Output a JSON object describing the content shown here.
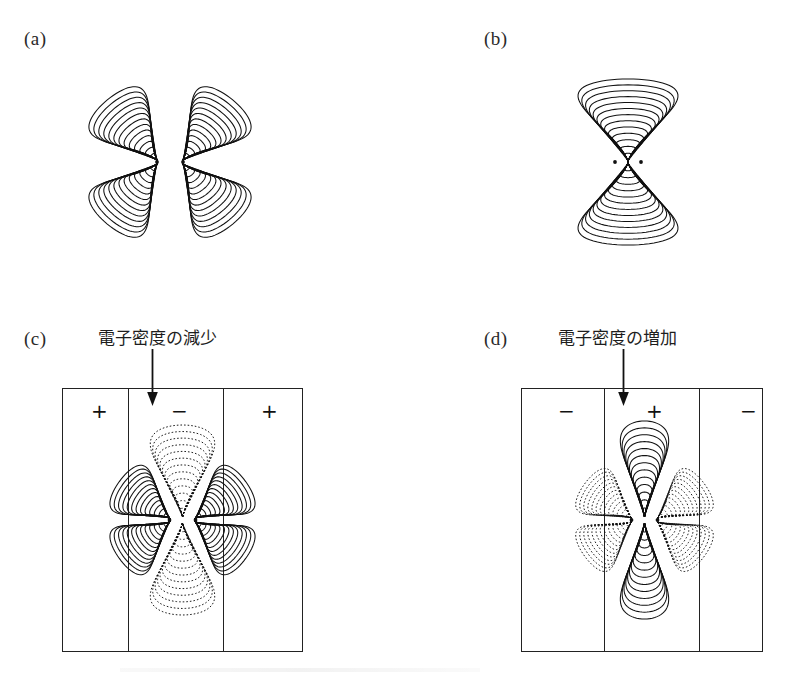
{
  "figure": {
    "background": "#ffffff",
    "ink": "#1a1a1a",
    "panels": [
      {
        "id": "a",
        "label": "(a)",
        "kind": "contour-plot",
        "description": "four-lobed pi antibonding electron density contour map, all solid contours",
        "lobes": 4,
        "lobe_style": [
          "solid",
          "solid",
          "solid",
          "solid"
        ],
        "contour_count": 13,
        "nuclei": 2,
        "boxed": false
      },
      {
        "id": "b",
        "label": "(b)",
        "kind": "contour-plot",
        "description": "two-lobed pi bonding electron density contour map, all solid contours",
        "lobes": 2,
        "lobe_style": [
          "solid",
          "solid"
        ],
        "contour_count": 13,
        "nuclei": 2,
        "boxed": false
      },
      {
        "id": "c",
        "label": "(c)",
        "kind": "contour-plot-boxed",
        "description": "difference density map in a three-band field box; horizontal lobes solid, vertical lobes dotted",
        "annotation": "電子密度の減少",
        "annotation_meaning": "decrease in electron density",
        "band_signs": [
          "+",
          "−",
          "+"
        ],
        "lobes": 4,
        "lobe_style": [
          "solid",
          "dotted",
          "solid",
          "dotted"
        ],
        "contour_count": 13,
        "nuclei": 2,
        "boxed": true,
        "arrow": "down-arrow"
      },
      {
        "id": "d",
        "label": "(d)",
        "kind": "contour-plot-boxed",
        "description": "difference density map in a three-band field box; vertical lobes solid, diagonal lobes dotted",
        "annotation": "電子密度の増加",
        "annotation_meaning": "increase in electron density",
        "band_signs": [
          "−",
          "+",
          "−"
        ],
        "lobes": 6,
        "lobe_style": [
          "solid",
          "dotted",
          "dotted",
          "solid",
          "dotted",
          "dotted"
        ],
        "contour_count": 13,
        "nuclei": 2,
        "boxed": true,
        "arrow": "down-arrow"
      }
    ]
  },
  "chart_data": {
    "type": "contour",
    "title": "",
    "xlabel": "",
    "ylabel": "",
    "grid": false,
    "legend": "none",
    "panel_count": 4,
    "panels": [
      {
        "id": "a",
        "label": "(a)",
        "lobe_directions": [
          "upper-left",
          "upper-right",
          "lower-left",
          "lower-right"
        ],
        "lobe_linestyles": [
          "solid",
          "solid",
          "solid",
          "solid"
        ],
        "contour_levels": 13,
        "nuclei_positions": [
          [
            -0.18,
            0.0
          ],
          [
            0.18,
            0.0
          ]
        ],
        "nodal_planes": [
          "horizontal",
          "vertical"
        ]
      },
      {
        "id": "b",
        "label": "(b)",
        "lobe_directions": [
          "up",
          "down"
        ],
        "lobe_linestyles": [
          "solid",
          "solid"
        ],
        "contour_levels": 13,
        "nuclei_positions": [
          [
            -0.18,
            0.0
          ],
          [
            0.18,
            0.0
          ]
        ],
        "nodal_planes": [
          "horizontal"
        ]
      },
      {
        "id": "c",
        "label": "(c)",
        "annotation": "電子密度の減少",
        "band_signs": [
          "+",
          "−",
          "+"
        ],
        "lobe_directions": [
          "left",
          "up",
          "right",
          "down"
        ],
        "lobe_linestyles": [
          "solid",
          "dotted",
          "solid",
          "dotted"
        ],
        "contour_levels": 13,
        "nuclei_positions": [
          [
            -0.18,
            0.0
          ],
          [
            0.18,
            0.0
          ]
        ],
        "nodal_planes": [
          "horizontal",
          "vertical"
        ]
      },
      {
        "id": "d",
        "label": "(d)",
        "annotation": "電子密度の増加",
        "band_signs": [
          "−",
          "+",
          "−"
        ],
        "lobe_directions": [
          "up",
          "down",
          "upper-left",
          "upper-right",
          "lower-left",
          "lower-right"
        ],
        "lobe_linestyles": [
          "solid",
          "solid",
          "dotted",
          "dotted",
          "dotted",
          "dotted"
        ],
        "contour_levels": 13,
        "nuclei_positions": [
          [
            -0.18,
            0.0
          ],
          [
            0.18,
            0.0
          ]
        ],
        "nodal_planes": [
          "horizontal",
          "vertical"
        ]
      }
    ]
  }
}
